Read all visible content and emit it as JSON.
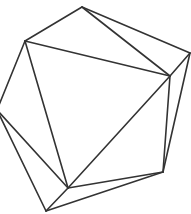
{
  "diagram": {
    "stroke_color": "#333333",
    "background": "#ffffff",
    "vertices": {
      "top": [
        82,
        7
      ],
      "upper_left": [
        25,
        41
      ],
      "right_outer": [
        190,
        53
      ],
      "right_inner": [
        170,
        76
      ],
      "left": [
        -3,
        110
      ],
      "bottom_right": [
        163,
        172
      ],
      "bottom_inner": [
        68,
        188
      ],
      "bottom": [
        46,
        211
      ]
    },
    "edges": [
      [
        "top",
        "upper_left"
      ],
      [
        "top",
        "right_outer"
      ],
      [
        "top",
        "right_inner"
      ],
      [
        "upper_left",
        "right_inner"
      ],
      [
        "upper_left",
        "left"
      ],
      [
        "upper_left",
        "bottom_inner"
      ],
      [
        "right_outer",
        "right_inner"
      ],
      [
        "right_outer",
        "bottom_right"
      ],
      [
        "right_inner",
        "bottom_right"
      ],
      [
        "right_inner",
        "bottom_inner"
      ],
      [
        "left",
        "bottom_inner"
      ],
      [
        "left",
        "bottom"
      ],
      [
        "bottom_inner",
        "bottom_right"
      ],
      [
        "bottom",
        "bottom_right"
      ],
      [
        "bottom",
        "bottom_inner"
      ]
    ]
  }
}
